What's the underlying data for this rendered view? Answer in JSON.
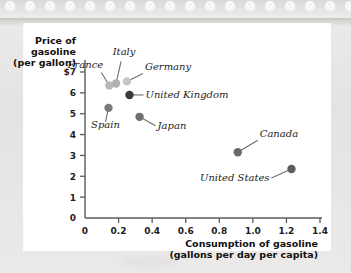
{
  "figure": {
    "background_color": "#ffffff",
    "paper_color": "#e8e8e6"
  },
  "chart_data": {
    "type": "scatter",
    "title": "",
    "xlabel": "Consumption of gasoline (gallons per day per capita)",
    "xlabel_line1": "Consumption of gasoline",
    "xlabel_line2": "(gallons per day per capita)",
    "ylabel": "Price of gasoline (per gallon)",
    "ylabel_line1": "Price of",
    "ylabel_line2": "gasoline",
    "ylabel_line3": "(per gallon)",
    "xlim": [
      0,
      1.4
    ],
    "ylim": [
      0,
      7
    ],
    "grid": false,
    "legend": "none",
    "xticks": [
      0,
      0.2,
      0.4,
      0.6,
      0.8,
      1.0,
      1.2,
      1.4
    ],
    "xtick_labels": [
      "0",
      "0.2",
      "0.4",
      "0.6",
      "0.8",
      "1.0",
      "1.2",
      "1.4"
    ],
    "yticks": [
      0,
      1,
      2,
      3,
      4,
      5,
      6,
      7
    ],
    "ytick_labels": [
      "0",
      "1",
      "2",
      "3",
      "4",
      "5",
      "6",
      "$7"
    ],
    "points": [
      {
        "label": "France",
        "x": 0.145,
        "y": 6.35,
        "color": "#b8b8b8"
      },
      {
        "label": "Italy",
        "x": 0.185,
        "y": 6.45,
        "color": "#b0b0b0"
      },
      {
        "label": "Germany",
        "x": 0.25,
        "y": 6.55,
        "color": "#c6c6c6"
      },
      {
        "label": "United Kingdom",
        "x": 0.265,
        "y": 5.9,
        "color": "#3a3a3a"
      },
      {
        "label": "Spain",
        "x": 0.14,
        "y": 5.28,
        "color": "#7a7a7a"
      },
      {
        "label": "Japan",
        "x": 0.325,
        "y": 4.85,
        "color": "#6e6e6e"
      },
      {
        "label": "Canada",
        "x": 0.91,
        "y": 3.15,
        "color": "#6a6a6a"
      },
      {
        "label": "United States",
        "x": 1.23,
        "y": 2.35,
        "color": "#5e5e5e"
      }
    ]
  }
}
